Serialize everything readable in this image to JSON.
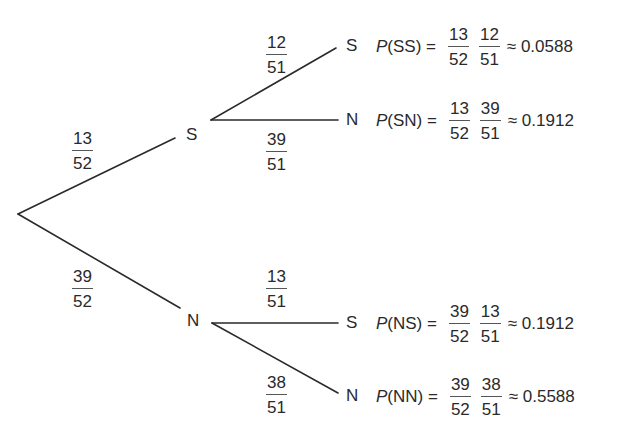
{
  "diagram": {
    "type": "probability-tree",
    "level1": {
      "upper": {
        "node": "S",
        "prob": {
          "num": "13",
          "den": "52"
        }
      },
      "lower": {
        "node": "N",
        "prob": {
          "num": "39",
          "den": "52"
        }
      }
    },
    "level2": {
      "SS": {
        "node": "S",
        "prob": {
          "num": "12",
          "den": "51"
        }
      },
      "SN": {
        "node": "N",
        "prob": {
          "num": "39",
          "den": "51"
        }
      },
      "NS": {
        "node": "S",
        "prob": {
          "num": "13",
          "den": "51"
        }
      },
      "NN": {
        "node": "N",
        "prob": {
          "num": "38",
          "den": "51"
        }
      }
    },
    "outcomes": [
      {
        "p": "P",
        "label": "(SS) =",
        "f1": {
          "num": "13",
          "den": "52"
        },
        "f2": {
          "num": "12",
          "den": "51"
        },
        "approx": "≈ 0.0588"
      },
      {
        "p": "P",
        "label": "(SN) =",
        "f1": {
          "num": "13",
          "den": "52"
        },
        "f2": {
          "num": "39",
          "den": "51"
        },
        "approx": "≈ 0.1912"
      },
      {
        "p": "P",
        "label": "(NS) =",
        "f1": {
          "num": "39",
          "den": "52"
        },
        "f2": {
          "num": "13",
          "den": "51"
        },
        "approx": "≈ 0.1912"
      },
      {
        "p": "P",
        "label": "(NN) =",
        "f1": {
          "num": "39",
          "den": "52"
        },
        "f2": {
          "num": "38",
          "den": "51"
        },
        "approx": "≈ 0.5588"
      }
    ]
  }
}
